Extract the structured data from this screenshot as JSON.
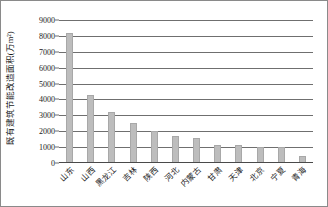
{
  "chart_data": {
    "type": "bar",
    "title": "",
    "xlabel": "",
    "ylabel": "既有建筑节能改造面积(万m²)",
    "ylim": [
      0,
      9000
    ],
    "ytick_labels": [
      "9000",
      "8000",
      "7000",
      "6000",
      "5000",
      "4000",
      "3000",
      "2000",
      "1000",
      "0"
    ],
    "yticks": [
      9000,
      8000,
      7000,
      6000,
      5000,
      4000,
      3000,
      2000,
      1000,
      0
    ],
    "grid": true,
    "legend": "none",
    "bar_color": "#bdbdbd",
    "categories": [
      "山东",
      "山西",
      "黑龙江",
      "吉林",
      "陕西",
      "河北",
      "内蒙古",
      "甘肃",
      "天津",
      "北京",
      "宁夏",
      "青海"
    ],
    "values": [
      8200,
      4300,
      3200,
      2500,
      2000,
      1700,
      1550,
      1150,
      1130,
      1000,
      980,
      450
    ]
  }
}
